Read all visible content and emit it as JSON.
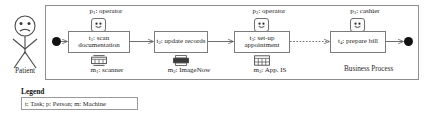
{
  "diagram": {
    "frame_label": "Business Process",
    "actor": {
      "icon": "stick-figure-person-icon",
      "label": "Patient"
    },
    "start_node": "start-event-node",
    "end_node": "end-event-node",
    "tasks": [
      {
        "id": "t1",
        "label": "t₁: scan documentation",
        "role": "p₁: operator",
        "role_icon": "smiley-person-icon",
        "machine": "m₁: scanner",
        "machine_icon": "scanner-machine-icon"
      },
      {
        "id": "t2",
        "label": "t₂: update records",
        "role": "",
        "role_icon": "",
        "machine": "m₂: ImageNow",
        "machine_icon": "printer-machine-icon"
      },
      {
        "id": "t3",
        "label": "t₃: set-up appointment",
        "role": "p₂: operator",
        "role_icon": "smiley-person-icon",
        "machine": "m₃: App. IS",
        "machine_icon": "server-machine-icon"
      },
      {
        "id": "t4",
        "label": "t₄: prepare bill",
        "role": "p₃: cashier",
        "role_icon": "smiley-person-icon",
        "machine": "",
        "machine_icon": ""
      }
    ],
    "legend": {
      "title": "Legend",
      "text": "t: Task; p: Person; m: Machine"
    },
    "colors": {
      "line": "#7c7c7c",
      "frame": "#8d8d8d",
      "node": "#111111",
      "text": "#232323",
      "background": "#ffffff"
    }
  }
}
